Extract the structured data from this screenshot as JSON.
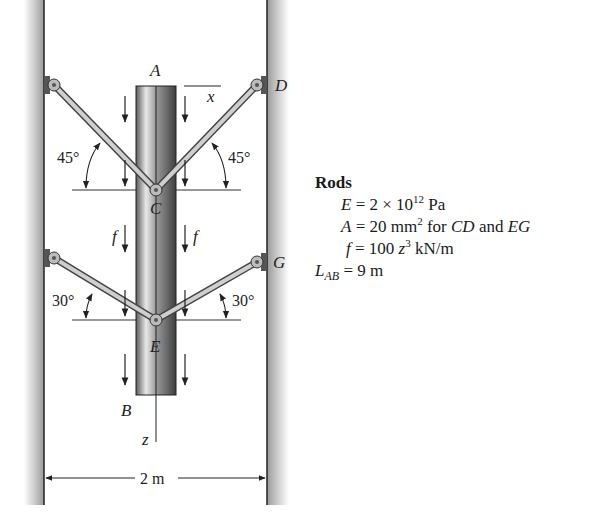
{
  "figure": {
    "points": {
      "A": "A",
      "B": "B",
      "C": "C",
      "D": "D",
      "E": "E",
      "G": "G"
    },
    "axes": {
      "x": "x",
      "z": "z"
    },
    "load_label": "f",
    "angles": {
      "upper": "45°",
      "lower": "30°"
    },
    "dimension": "2 m"
  },
  "panel": {
    "title": "Rods",
    "E_sym": "E",
    "E_val": " = 2 × 10",
    "E_exp": "12",
    "E_unit": " Pa",
    "A_sym": "A",
    "A_val": " = 20 mm",
    "A_exp": "2",
    "A_for": " for ",
    "A_rod1": "CD",
    "A_and": " and ",
    "A_rod2": "EG",
    "f_sym": "f",
    "f_val": " = 100 ",
    "f_var": "z",
    "f_exp": "3",
    "f_unit": " kN/m",
    "L_sym": "L",
    "L_sub": "AB",
    "L_val": " = 9 m"
  }
}
